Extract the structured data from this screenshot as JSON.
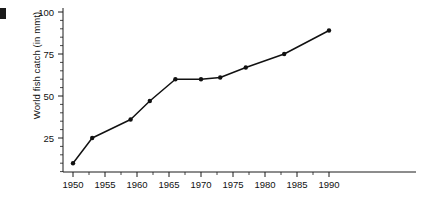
{
  "chart_data": {
    "type": "line",
    "title": "",
    "xlabel": "",
    "ylabel": "World fish catch (in mmt)",
    "xlim": [
      1948,
      1992
    ],
    "ylim": [
      0,
      100
    ],
    "grid": false,
    "legend": false,
    "x_ticks": [
      "1950",
      "1955",
      "1960",
      "1965",
      "1970",
      "1975",
      "1980",
      "1985",
      "1990"
    ],
    "x_tick_values": [
      1950,
      1955,
      1960,
      1965,
      1970,
      1975,
      1980,
      1985,
      1990
    ],
    "y_ticks": [
      "25",
      "50",
      "75",
      "100"
    ],
    "y_tick_values": [
      25,
      50,
      75,
      100
    ],
    "series": [
      {
        "name": "World fish catch",
        "x": [
          1950,
          1953,
          1959,
          1962,
          1966,
          1970,
          1973,
          1977,
          1983,
          1990
        ],
        "values": [
          10,
          25,
          36,
          47,
          60,
          60,
          61,
          67,
          75,
          89
        ]
      }
    ],
    "points": [
      {
        "year": 1950,
        "value": 10
      },
      {
        "year": 1953,
        "value": 25
      },
      {
        "year": 1959,
        "value": 36
      },
      {
        "year": 1962,
        "value": 47
      },
      {
        "year": 1966,
        "value": 60
      },
      {
        "year": 1970,
        "value": 60
      },
      {
        "year": 1973,
        "value": 61
      },
      {
        "year": 1977,
        "value": 67
      },
      {
        "year": 1983,
        "value": 75
      },
      {
        "year": 1990,
        "value": 89
      }
    ],
    "colors": {
      "line": "#111111",
      "marker": "#111111",
      "axis": "#1a1a1a",
      "background": "#ffffff"
    }
  }
}
